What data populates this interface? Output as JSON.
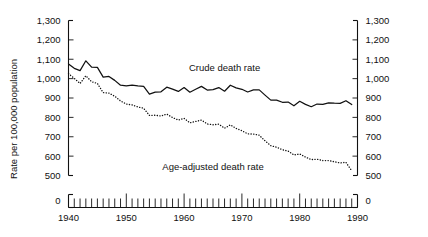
{
  "chart_data": {
    "type": "line",
    "title": "",
    "xlabel": "",
    "ylabel": "Rate per 100,000 population",
    "xlim": [
      1940,
      1990
    ],
    "ylim": [
      500,
      1300
    ],
    "y_axis_broken": true,
    "y_break_label": "0",
    "grid": false,
    "legend_position": "inline-annotation",
    "ytick_labels": [
      "1,300",
      "1,200",
      "1,100",
      "1,000",
      "900",
      "800",
      "700",
      "600",
      "500",
      "0"
    ],
    "ytick_values": [
      1300,
      1200,
      1100,
      1000,
      900,
      800,
      700,
      600,
      500,
      0
    ],
    "xtick_labels": [
      "1940",
      "1950",
      "1960",
      "1970",
      "1980",
      "1990"
    ],
    "xtick_values": [
      1940,
      1950,
      1960,
      1970,
      1980,
      1990
    ],
    "xtick_minor_interval": 1,
    "x": [
      1940,
      1941,
      1942,
      1943,
      1944,
      1945,
      1946,
      1947,
      1948,
      1949,
      1950,
      1951,
      1952,
      1953,
      1954,
      1955,
      1956,
      1957,
      1958,
      1959,
      1960,
      1961,
      1962,
      1963,
      1964,
      1965,
      1966,
      1967,
      1968,
      1969,
      1970,
      1971,
      1972,
      1973,
      1974,
      1975,
      1976,
      1977,
      1978,
      1979,
      1980,
      1981,
      1982,
      1983,
      1984,
      1985,
      1986,
      1987,
      1988,
      1989
    ],
    "series": [
      {
        "name": "Crude death rate",
        "style": "solid",
        "color": "#111111",
        "values": [
          1076,
          1053,
          1041,
          1092,
          1059,
          1058,
          1008,
          1011,
          991,
          966,
          963,
          966,
          962,
          960,
          920,
          930,
          932,
          956,
          946,
          934,
          954,
          930,
          945,
          960,
          941,
          943,
          954,
          935,
          966,
          952,
          945,
          931,
          942,
          942,
          915,
          889,
          889,
          878,
          879,
          860,
          883,
          867,
          855,
          869,
          867,
          875,
          873,
          872,
          886,
          866
        ]
      },
      {
        "name": "Age-adjusted death rate",
        "style": "dotted",
        "color": "#111111",
        "values": [
          1026,
          1001,
          975,
          1015,
          984,
          975,
          928,
          925,
          909,
          885,
          869,
          864,
          854,
          847,
          810,
          811,
          807,
          817,
          799,
          786,
          795,
          772,
          779,
          786,
          766,
          762,
          765,
          744,
          761,
          743,
          731,
          715,
          714,
          708,
          679,
          654,
          646,
          633,
          626,
          606,
          611,
          595,
          582,
          584,
          577,
          577,
          571,
          565,
          568,
          524
        ]
      }
    ],
    "annotations": [
      {
        "text": "Crude death rate",
        "x": 1967,
        "y": 1055
      },
      {
        "text": "Age-adjusted death rate",
        "x": 1965,
        "y": 545
      }
    ]
  }
}
